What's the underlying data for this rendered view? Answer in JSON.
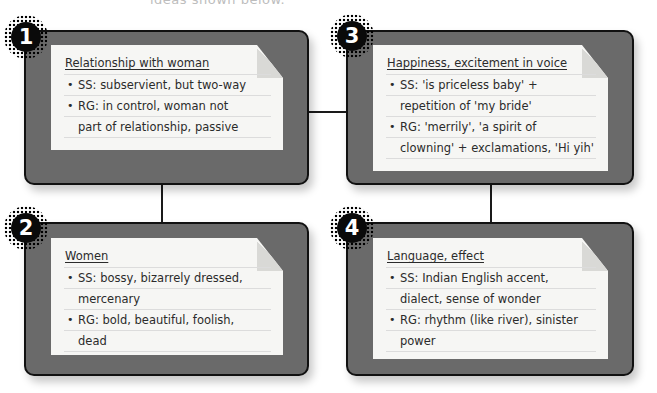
{
  "caption": "ideas shown below.",
  "colors": {
    "box_fill": "#6a6a6a",
    "box_border": "#111111",
    "paper": "#f6f6f4",
    "badge": "#0a0a0a",
    "text": "#2b2b2b"
  },
  "boxes": [
    {
      "number": "1",
      "title": "Relationship with woman",
      "lines": [
        {
          "bullet": true,
          "text": "SS: subservient, but two-way"
        },
        {
          "bullet": true,
          "text": "RG: in control, woman not"
        },
        {
          "bullet": false,
          "text": "part of relationship, passive"
        }
      ]
    },
    {
      "number": "2",
      "title": "Women",
      "lines": [
        {
          "bullet": true,
          "text": "SS: bossy, bizarrely dressed,"
        },
        {
          "bullet": false,
          "text": "mercenary"
        },
        {
          "bullet": true,
          "text": "RG: bold, beautiful, foolish,"
        },
        {
          "bullet": false,
          "text": "dead"
        }
      ]
    },
    {
      "number": "3",
      "title": "Happiness, excitement in voice",
      "lines": [
        {
          "bullet": true,
          "text": "SS: 'is priceless baby' +"
        },
        {
          "bullet": false,
          "text": "repetition of 'my bride'"
        },
        {
          "bullet": true,
          "text": "RG: 'merrily', 'a spirit of"
        },
        {
          "bullet": false,
          "text": "clowning' + exclamations, 'Hi yih'"
        }
      ]
    },
    {
      "number": "4",
      "title": "Language, effect",
      "lines": [
        {
          "bullet": true,
          "text": "SS: Indian English accent,"
        },
        {
          "bullet": false,
          "text": "dialect, sense of wonder"
        },
        {
          "bullet": true,
          "text": "RG: rhythm (like river), sinister"
        },
        {
          "bullet": false,
          "text": "power"
        }
      ]
    }
  ],
  "bullet_glyph": "•"
}
